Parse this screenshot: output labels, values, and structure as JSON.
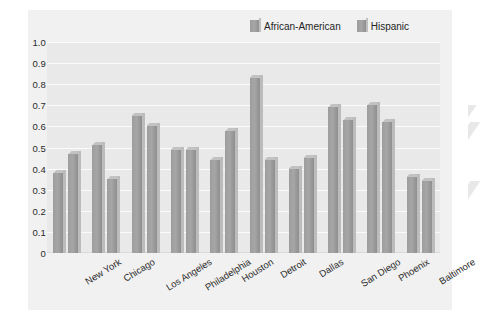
{
  "chart_data": {
    "type": "bar",
    "title": "",
    "subtitle": "",
    "xlabel": "",
    "ylabel": "",
    "ylim": [
      0,
      1.0
    ],
    "yticks": [
      "0",
      "0.1",
      "0.2",
      "0.3",
      "0.4",
      "0.5",
      "0.6",
      "0.7",
      "0.8",
      "0.9",
      "1.0"
    ],
    "ytick_values": [
      0,
      0.1,
      0.2,
      0.3,
      0.4,
      0.5,
      0.6,
      0.7,
      0.8,
      0.9,
      1.0
    ],
    "grid": "horizontal",
    "legend_position": "top-right",
    "categories": [
      "New York",
      "Chicago",
      "Los Angeles",
      "Philadelphia",
      "Houston",
      "Detroit",
      "Dallas",
      "San Diego",
      "Phoenix",
      "Baltimore"
    ],
    "series": [
      {
        "name": "African-American",
        "color": "#a0a0a0",
        "values": [
          0.38,
          0.51,
          0.65,
          0.49,
          0.44,
          0.83,
          0.4,
          0.69,
          0.7,
          0.36
        ]
      },
      {
        "name": "Hispanic",
        "color": "#a0a0a0",
        "values": [
          0.47,
          0.35,
          0.6,
          0.49,
          0.58,
          0.44,
          0.45,
          0.63,
          0.62,
          0.34
        ]
      }
    ],
    "annotations": []
  },
  "legend": {
    "items": [
      {
        "label": "African-American",
        "swatch": "legend-swatch-african-american"
      },
      {
        "label": "Hispanic",
        "swatch": "legend-swatch-hispanic"
      }
    ]
  },
  "colors": {
    "panel_background": "#f1f1f1",
    "plot_background": "#e9e9e9",
    "gridline": "#fbfbfb",
    "bar_face": "#a0a0a0",
    "bar_side": "#bcbcbc",
    "bar_top": "#c2c2c2",
    "text": "#2b2b2b"
  }
}
